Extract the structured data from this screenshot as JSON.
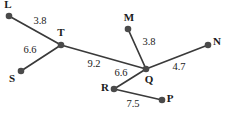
{
  "figure": {
    "type": "weighted-graph-diagram",
    "background_color": "#ffffff",
    "node_color": "#4a4a4a",
    "edge_color": "#3a3a3a",
    "label_color": "#1a1a1a"
  },
  "nodes": [
    {
      "id": "L",
      "label": "L",
      "x": 9,
      "y": 16,
      "label_x": 8,
      "label_y": 5
    },
    {
      "id": "T",
      "label": "T",
      "x": 61,
      "y": 45,
      "label_x": 61,
      "label_y": 33
    },
    {
      "id": "S",
      "label": "S",
      "x": 21,
      "y": 71,
      "label_x": 12,
      "label_y": 79
    },
    {
      "id": "M",
      "label": "M",
      "x": 128,
      "y": 29,
      "label_x": 129,
      "label_y": 18
    },
    {
      "id": "Q",
      "label": "Q",
      "x": 146,
      "y": 69,
      "label_x": 149,
      "label_y": 80
    },
    {
      "id": "N",
      "label": "N",
      "x": 208,
      "y": 45,
      "label_x": 217,
      "label_y": 42
    },
    {
      "id": "R",
      "label": "R",
      "x": 114,
      "y": 89,
      "label_x": 105,
      "label_y": 88
    },
    {
      "id": "P",
      "label": "P",
      "x": 162,
      "y": 100,
      "label_x": 170,
      "label_y": 99
    }
  ],
  "edges": [
    {
      "from": "L",
      "to": "T",
      "weight": "3.8",
      "x1": 9,
      "y1": 16,
      "x2": 61,
      "y2": 45,
      "label_x": 40,
      "label_y": 22
    },
    {
      "from": "S",
      "to": "T",
      "weight": "6.6",
      "x1": 21,
      "y1": 71,
      "x2": 61,
      "y2": 45,
      "label_x": 30,
      "label_y": 51
    },
    {
      "from": "T",
      "to": "Q",
      "weight": "9.2",
      "x1": 61,
      "y1": 45,
      "x2": 146,
      "y2": 69,
      "label_x": 94,
      "label_y": 65
    },
    {
      "from": "M",
      "to": "Q",
      "weight": "3.8",
      "x1": 128,
      "y1": 29,
      "x2": 146,
      "y2": 69,
      "label_x": 149,
      "label_y": 43
    },
    {
      "from": "Q",
      "to": "N",
      "weight": "4.7",
      "x1": 146,
      "y1": 69,
      "x2": 208,
      "y2": 45,
      "label_x": 179,
      "label_y": 68
    },
    {
      "from": "Q",
      "to": "R",
      "weight": "6.6",
      "x1": 146,
      "y1": 69,
      "x2": 114,
      "y2": 89,
      "label_x": 121,
      "label_y": 74
    },
    {
      "from": "R",
      "to": "P",
      "weight": "7.5",
      "x1": 114,
      "y1": 89,
      "x2": 162,
      "y2": 100,
      "label_x": 133,
      "label_y": 105
    }
  ]
}
